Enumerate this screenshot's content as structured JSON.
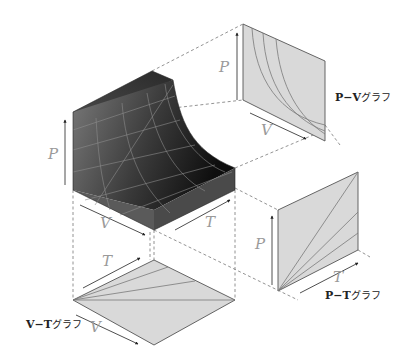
{
  "diagram": {
    "surface": {
      "axes": {
        "p": "P",
        "v": "V",
        "t": "T"
      }
    },
    "pv_graph": {
      "title_vars": "P−V",
      "title_suffix": "グラフ",
      "axis_p": "P",
      "axis_v": "V",
      "curve_type": "isotherms (hyperbolas)",
      "curve_count": 4
    },
    "pt_graph": {
      "title_vars": "P−T",
      "title_suffix": "グラフ",
      "axis_p": "P",
      "axis_t": "T",
      "curve_type": "isochores (straight lines through origin)",
      "curve_count": 4
    },
    "vt_graph": {
      "title_vars": "V−T",
      "title_suffix": "グラフ",
      "axis_v": "V",
      "axis_t": "T",
      "curve_type": "isobars (straight lines through origin)",
      "curve_count": 4
    },
    "colors": {
      "surface_dark": "#1a1a1a",
      "surface_light": "#8a8a8a",
      "panel_fill": "#d9d9d9",
      "panel_stroke": "#555555",
      "grid_line": "#8c8c8c",
      "dashed": "#777777",
      "label": "#9a9a9a"
    }
  }
}
